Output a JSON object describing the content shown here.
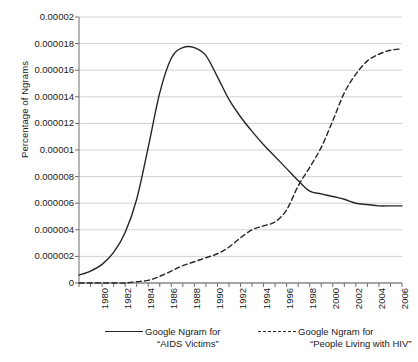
{
  "chart_data": {
    "type": "line",
    "title": "",
    "xlabel": "",
    "ylabel": "Percentage of Ngrams",
    "xlim": [
      1980,
      2008
    ],
    "ylim": [
      0,
      2e-05
    ],
    "grid": "horizontal",
    "legend_position": "bottom",
    "y_ticks": [
      "0",
      "0.000002",
      "0.000004",
      "0.000006",
      "0.000008",
      "0.00001",
      "0.000012",
      "0.000014",
      "0.000016",
      "0.000018",
      "0.00002"
    ],
    "y_tick_values": [
      0,
      2e-06,
      4e-06,
      6e-06,
      8e-06,
      1e-05,
      1.2e-05,
      1.4e-05,
      1.6e-05,
      1.8e-05,
      2e-05
    ],
    "x_ticks": [
      "1980",
      "1982",
      "1984",
      "1986",
      "1988",
      "1990",
      "1992",
      "1994",
      "1996",
      "1998",
      "2000",
      "2002",
      "2004",
      "2006",
      "2008"
    ],
    "x_tick_values": [
      1980,
      1982,
      1984,
      1986,
      1988,
      1990,
      1992,
      1994,
      1996,
      1998,
      2000,
      2002,
      2004,
      2006,
      2008
    ],
    "x": [
      1980,
      1981,
      1982,
      1983,
      1984,
      1985,
      1986,
      1987,
      1988,
      1989,
      1990,
      1991,
      1992,
      1993,
      1994,
      1995,
      1996,
      1997,
      1998,
      1999,
      2000,
      2001,
      2002,
      2003,
      2004,
      2005,
      2006,
      2007,
      2008
    ],
    "series": [
      {
        "name": "Google Ngram for “AIDS Victims”",
        "style": "solid",
        "color": "#262626",
        "values": [
          6e-07,
          9e-07,
          1.4e-06,
          2.3e-06,
          3.8e-06,
          6.3e-06,
          1.02e-05,
          1.43e-05,
          1.69e-05,
          1.77e-05,
          1.77e-05,
          1.71e-05,
          1.55e-05,
          1.38e-05,
          1.25e-05,
          1.14e-05,
          1.04e-05,
          9.5e-06,
          8.6e-06,
          7.7e-06,
          6.9e-06,
          6.7e-06,
          6.5e-06,
          6.3e-06,
          6e-06,
          5.9e-06,
          5.8e-06,
          5.8e-06,
          5.8e-06
        ]
      },
      {
        "name": "Google Ngram for “People Living with HIV”",
        "style": "dashed",
        "color": "#262626",
        "values": [
          0.0,
          0.0,
          0.0,
          0.0,
          0.0,
          1e-07,
          2e-07,
          5e-07,
          9e-07,
          1.3e-06,
          1.6e-06,
          1.9e-06,
          2.2e-06,
          2.7e-06,
          3.4e-06,
          4e-06,
          4.3e-06,
          4.6e-06,
          5.5e-06,
          7.3e-06,
          8.7e-06,
          1.02e-05,
          1.22e-05,
          1.43e-05,
          1.57e-05,
          1.67e-05,
          1.72e-05,
          1.75e-05,
          1.76e-05
        ]
      }
    ]
  },
  "legend": {
    "entries": [
      {
        "line1": "Google Ngram for",
        "line2": "“AIDS Victims”",
        "style": "solid"
      },
      {
        "line1": "Google Ngram for",
        "line2": "“People Living with HIV”",
        "style": "dashed"
      }
    ]
  },
  "axes": {
    "y_title": "Percentage of Ngrams"
  }
}
